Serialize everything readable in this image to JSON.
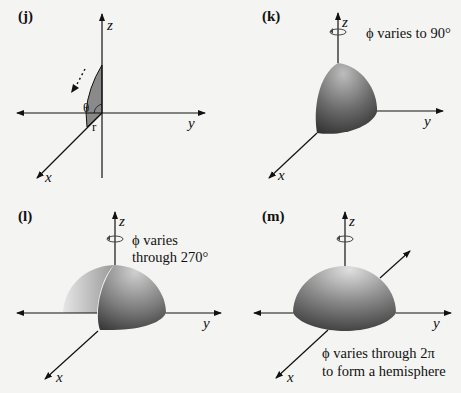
{
  "panels": [
    {
      "id": "j",
      "label": "(j)",
      "axes": {
        "z": "z",
        "y": "y",
        "x": "x"
      },
      "annotations": {
        "theta": "θ",
        "r": "r"
      },
      "description": "Shaded wedge in xz-plane; dotted arrow shows sweep direction"
    },
    {
      "id": "k",
      "label": "(k)",
      "axes": {
        "z": "z",
        "y": "y",
        "x": "x"
      },
      "caption_lines": [
        "ϕ varies to 90°"
      ],
      "description": "One octant of sphere"
    },
    {
      "id": "l",
      "label": "(l)",
      "axes": {
        "z": "z",
        "y": "y",
        "x": "x"
      },
      "caption_lines": [
        "ϕ varies",
        "through 270°"
      ],
      "description": "Three-quarter hemisphere"
    },
    {
      "id": "m",
      "label": "(m)",
      "axes": {
        "z": "z",
        "y": "y",
        "x": "x"
      },
      "caption_lines": [
        "ϕ varies through 2π",
        "to form a hemisphere"
      ],
      "description": "Full hemisphere"
    }
  ],
  "colors": {
    "background": "#f4f4f2",
    "line": "#111111",
    "shade_dark": "#3a3a3a",
    "shade_mid": "#8a8a8a",
    "shade_light": "#d6d6d6"
  }
}
